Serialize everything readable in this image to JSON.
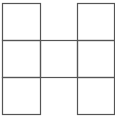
{
  "diagram": {
    "stroke_color": "#555555",
    "background": "#ffffff",
    "vertical_lines_x": [
      2,
      40,
      77,
      114
    ],
    "horizontal_lines_y": [
      3,
      40,
      77,
      114
    ],
    "cells": [
      {
        "row": 0,
        "col": 0
      },
      {
        "row": 0,
        "col": 2
      },
      {
        "row": 1,
        "col": 0
      },
      {
        "row": 1,
        "col": 1
      },
      {
        "row": 1,
        "col": 2
      },
      {
        "row": 2,
        "col": 0
      },
      {
        "row": 2,
        "col": 2
      }
    ]
  }
}
